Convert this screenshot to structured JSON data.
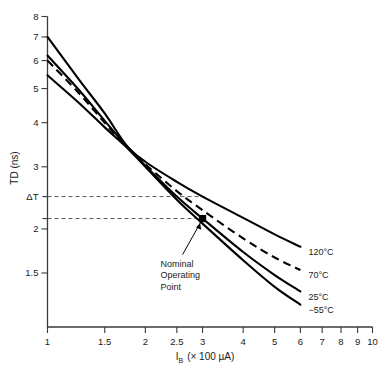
{
  "chart_data": {
    "type": "line",
    "title": "",
    "subtitle": "",
    "xlabel": "I_B (× 100 µA)",
    "ylabel": "TD (ns)",
    "xscale": "log",
    "yscale": "log",
    "xlim": [
      1,
      10
    ],
    "ylim": [
      1.1,
      8
    ],
    "grid": false,
    "legend_position": "right-of-curve-ends",
    "xticks": [
      1,
      1.5,
      2,
      2.5,
      3,
      4,
      5,
      6,
      7,
      8,
      9,
      10
    ],
    "xticklabels": [
      "1",
      "1.5",
      "2",
      "2.5",
      "3",
      "4",
      "5",
      "6",
      "7",
      "8",
      "9",
      "10"
    ],
    "yticks": [
      1.5,
      2,
      3,
      4,
      5,
      6,
      7,
      8
    ],
    "yticklabels": [
      "1.5",
      "2",
      "3",
      "4",
      "5",
      "6",
      "7",
      "8"
    ],
    "series": [
      {
        "name": "120°C",
        "label": "120°C",
        "style": "solid",
        "x": [
          1,
          1.25,
          1.5,
          1.75,
          2,
          2.5,
          3,
          4,
          5,
          6
        ],
        "values": [
          7.0,
          5.3,
          4.25,
          3.45,
          3.1,
          2.72,
          2.47,
          2.15,
          1.93,
          1.78
        ]
      },
      {
        "name": "70°C",
        "label": "70°C",
        "style": "dashed",
        "x": [
          1,
          1.25,
          1.5,
          1.75,
          2,
          2.5,
          3,
          4,
          5,
          6
        ],
        "values": [
          6.0,
          4.85,
          4.0,
          3.42,
          3.05,
          2.56,
          2.26,
          1.88,
          1.66,
          1.53
        ]
      },
      {
        "name": "25°C",
        "label": "25°C",
        "style": "solid",
        "x": [
          1,
          1.25,
          1.5,
          1.75,
          2,
          2.5,
          3,
          4,
          5,
          6
        ],
        "values": [
          6.2,
          4.95,
          4.05,
          3.44,
          3.02,
          2.47,
          2.14,
          1.72,
          1.48,
          1.33
        ]
      },
      {
        "name": "−55°C",
        "label": "−55°C",
        "style": "solid",
        "x": [
          1,
          1.25,
          1.5,
          1.75,
          2,
          2.5,
          3,
          4,
          5,
          6
        ],
        "values": [
          5.45,
          4.55,
          3.88,
          3.41,
          3.0,
          2.42,
          2.07,
          1.63,
          1.37,
          1.22
        ]
      }
    ],
    "annotations": [
      {
        "name": "nominal-operating-point",
        "text_lines": [
          "Nominal",
          "Operating",
          "Point"
        ],
        "point_x": 3.0,
        "point_y": 2.14,
        "marker": "filled-square"
      },
      {
        "name": "delta-t-bracket",
        "text": "ΔT",
        "y_upper": 2.47,
        "y_lower": 2.14,
        "x_extent": 3.0,
        "style": "dashed"
      }
    ]
  },
  "axis": {
    "y_label": "TD (ns)",
    "x_label_main": "I",
    "x_label_sub": "B",
    "x_label_rest": "(× 100 µA)",
    "delta_t_label": "ΔT"
  },
  "colors": {
    "curve": "#000000",
    "axis": "#3a3a3a",
    "guide": "#5a5a5a",
    "background": "#ffffff",
    "text": "#1a1a1a"
  }
}
